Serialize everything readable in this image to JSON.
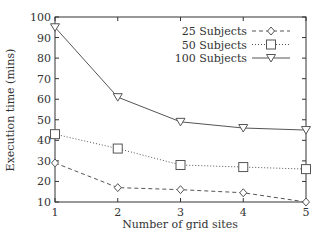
{
  "chart_data": {
    "type": "line",
    "title": "",
    "xlabel": "Number of grid sites",
    "ylabel": "Execution time (mins)",
    "x": [
      1,
      2,
      3,
      4,
      5
    ],
    "xticks": [
      "1",
      "2",
      "3",
      "4",
      "5"
    ],
    "yticks": [
      "10",
      "20",
      "30",
      "40",
      "50",
      "60",
      "70",
      "80",
      "90",
      "100"
    ],
    "xlim": [
      1,
      5
    ],
    "ylim": [
      10,
      100
    ],
    "grid": false,
    "legend_position": "upper right",
    "series": [
      {
        "name": "25 Subjects",
        "marker": "diamond",
        "line": "dashed",
        "values": [
          29,
          17,
          16,
          14.5,
          10
        ]
      },
      {
        "name": "50 Subjects",
        "marker": "square",
        "line": "dotted",
        "values": [
          43,
          36,
          28,
          27,
          26
        ]
      },
      {
        "name": "100 Subjects",
        "marker": "triangle-down",
        "line": "solid",
        "values": [
          95,
          61,
          49,
          46,
          45
        ]
      }
    ],
    "colors": {
      "axis": "#333333",
      "line": "#555555"
    }
  }
}
